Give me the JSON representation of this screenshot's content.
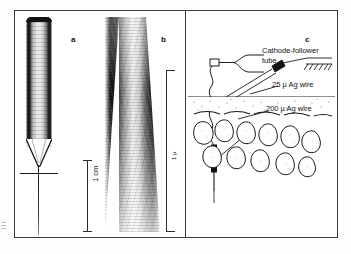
{
  "figure": {
    "panels": [
      {
        "id": "a",
        "letter": "a",
        "caption": "glass micropipette, low magnification photomicrograph"
      },
      {
        "id": "b",
        "letter": "b",
        "caption": "micropipette tip, high magnification photomicrograph"
      },
      {
        "id": "c",
        "letter": "c",
        "caption": "microelectrode recording arrangement schematic"
      }
    ],
    "scale_bar": {
      "label": "1 cm",
      "orientation": "vertical"
    },
    "panel_b_bracket": {
      "label": "1 µ",
      "orientation": "vertical"
    },
    "diagram_labels": [
      {
        "name": "cathode-follower-tube",
        "line1": "Cathode-follower",
        "line2": "tube"
      },
      {
        "name": "ag-wire-25",
        "text": "25 µ Ag wire"
      },
      {
        "name": "ag-wire-200",
        "text": "200 µ Ag wire"
      }
    ],
    "colors": {
      "ink": "#1a1a1a",
      "frame": "#3b3b3b",
      "paper": "#ffffff"
    }
  }
}
